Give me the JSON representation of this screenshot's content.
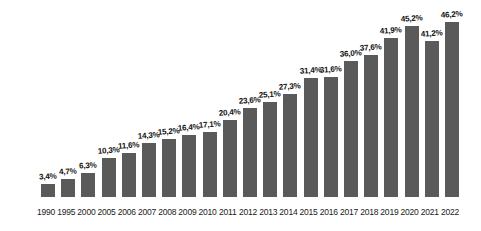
{
  "chart_data": {
    "type": "bar",
    "title": "",
    "xlabel": "",
    "ylabel": "",
    "ylim": [
      0,
      50
    ],
    "grid": false,
    "legend": "none",
    "bar_color": "#5a5a5a",
    "background_color": "#ffffff",
    "label_color": "#111111",
    "value_suffix": "%",
    "decimal_separator": ",",
    "categories": [
      "1990",
      "1995",
      "2000",
      "2005",
      "2006",
      "2007",
      "2008",
      "2009",
      "2010",
      "2011",
      "2012",
      "2013",
      "2014",
      "2015",
      "2016",
      "2017",
      "2018",
      "2019",
      "2020",
      "2021",
      "2022"
    ],
    "values": [
      3.4,
      4.7,
      6.3,
      10.3,
      11.6,
      14.3,
      15.2,
      16.4,
      17.1,
      20.4,
      23.6,
      25.1,
      27.3,
      31.4,
      31.6,
      36.0,
      37.6,
      41.9,
      45.2,
      41.2,
      46.2
    ],
    "value_labels": [
      "3,4%",
      "4,7%",
      "6,3%",
      "10,3%",
      "11,6%",
      "14,3%",
      "15,2%",
      "16,4%",
      "17,1%",
      "20,4%",
      "23,6%",
      "25,1%",
      "27,3%",
      "31,4%",
      "31,6%",
      "36,0%",
      "37,6%",
      "41,9%",
      "45,2%",
      "41,2%",
      "46,2%"
    ]
  }
}
